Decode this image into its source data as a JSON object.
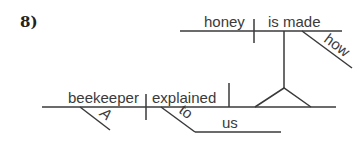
{
  "problem_number": "8)",
  "diagram": {
    "type": "sentence-diagram",
    "main_clause": {
      "subject": "beekeeper",
      "subject_modifier": "A",
      "verb": "explained",
      "prepositional_phrase": {
        "preposition": "to",
        "object": "us"
      }
    },
    "noun_clause": {
      "subject": "honey",
      "verb": "is made",
      "adverb": "how"
    }
  },
  "colors": {
    "line": "#3a3a3a",
    "text": "#3a3a3a",
    "background": "#ffffff"
  }
}
